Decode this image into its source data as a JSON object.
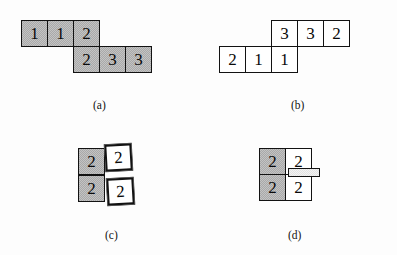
{
  "figure": {
    "background_color": "#fdfdfd",
    "shaded_color": "#a9a9a9",
    "plain_color": "#ffffff",
    "border_color": "#121212",
    "panels": [
      {
        "id": "a",
        "caption": "(a)",
        "style": "shaded",
        "cells": [
          {
            "value": "1",
            "col": 0,
            "row": 0,
            "fill": "shaded"
          },
          {
            "value": "1",
            "col": 1,
            "row": 0,
            "fill": "shaded"
          },
          {
            "value": "2",
            "col": 2,
            "row": 0,
            "fill": "shaded"
          },
          {
            "value": "2",
            "col": 2,
            "row": 1,
            "fill": "shaded"
          },
          {
            "value": "3",
            "col": 3,
            "row": 1,
            "fill": "shaded"
          },
          {
            "value": "3",
            "col": 4,
            "row": 1,
            "fill": "shaded"
          }
        ]
      },
      {
        "id": "b",
        "caption": "(b)",
        "style": "plain",
        "cells": [
          {
            "value": "3",
            "col": 2,
            "row": 0,
            "fill": "plain"
          },
          {
            "value": "3",
            "col": 3,
            "row": 0,
            "fill": "plain"
          },
          {
            "value": "2",
            "col": 4,
            "row": 0,
            "fill": "plain"
          },
          {
            "value": "2",
            "col": 0,
            "row": 1,
            "fill": "plain"
          },
          {
            "value": "1",
            "col": 1,
            "row": 1,
            "fill": "plain"
          },
          {
            "value": "1",
            "col": 2,
            "row": 1,
            "fill": "plain"
          }
        ]
      },
      {
        "id": "c",
        "caption": "(c)",
        "style": "mixed-lifted",
        "cells": [
          {
            "value": "2",
            "col": 0,
            "row": 0,
            "fill": "shaded"
          },
          {
            "value": "2",
            "col": 1,
            "row": 0,
            "fill": "lifted"
          },
          {
            "value": "2",
            "col": 0,
            "row": 1,
            "fill": "shaded"
          },
          {
            "value": "2",
            "col": 1,
            "row": 1,
            "fill": "lifted"
          }
        ]
      },
      {
        "id": "d",
        "caption": "(d)",
        "style": "mixed-flat",
        "cells": [
          {
            "value": "2",
            "col": 0,
            "row": 0,
            "fill": "shaded"
          },
          {
            "value": "2",
            "col": 1,
            "row": 0,
            "fill": "plain"
          },
          {
            "value": "2",
            "col": 0,
            "row": 1,
            "fill": "shaded"
          },
          {
            "value": "2",
            "col": 1,
            "row": 1,
            "fill": "plain"
          }
        ],
        "slide_bar": true
      }
    ]
  }
}
